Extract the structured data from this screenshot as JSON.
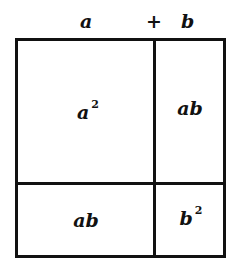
{
  "diagram": {
    "title_expression": {
      "a": "a",
      "plus": "+",
      "b": "b"
    },
    "cells": [
      {
        "id": "top-left",
        "base": "a",
        "exponent": "2"
      },
      {
        "id": "top-right",
        "base": "ab",
        "exponent": ""
      },
      {
        "id": "bottom-left",
        "base": "ab",
        "exponent": ""
      },
      {
        "id": "bottom-right",
        "base": "b",
        "exponent": "2"
      }
    ],
    "stroke_color": "#111111",
    "background": "#ffffff"
  }
}
